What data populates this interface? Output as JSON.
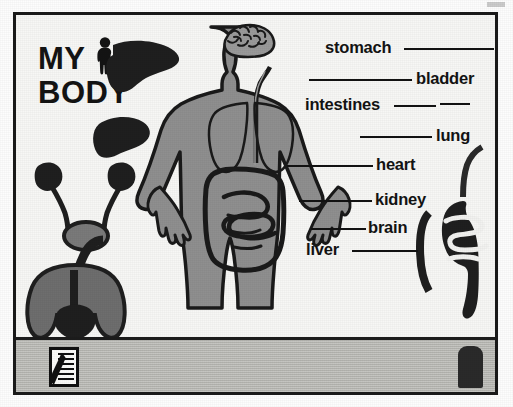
{
  "app": {
    "title_line1": "MY",
    "title_line2": "BODY",
    "person_icon": "person-silhouette-icon"
  },
  "canvas": {
    "background_color": "#f7f7f5",
    "figure_fill_color": "#8f8f8f",
    "outline_color": "#1a1a1a",
    "organ_silhouette_color": "#1f1f1f"
  },
  "labels": [
    {
      "id": "stomach",
      "text": "stomach",
      "leader": "right"
    },
    {
      "id": "bladder",
      "text": "bladder",
      "leader": "left"
    },
    {
      "id": "intestines",
      "text": "intestines",
      "leader": "right"
    },
    {
      "id": "lung",
      "text": "lung",
      "leader": "left"
    },
    {
      "id": "heart",
      "text": "heart",
      "leader": "left"
    },
    {
      "id": "kidney",
      "text": "kidney",
      "leader": "left"
    },
    {
      "id": "brain",
      "text": "brain",
      "leader": "left"
    },
    {
      "id": "liver",
      "text": "liver",
      "leader": "right"
    }
  ],
  "body_diagram": {
    "name": "human-body-figure",
    "organs_drawn": [
      "brain",
      "lungs",
      "heart",
      "esophagus",
      "stomach",
      "intestines"
    ]
  },
  "left_organ_silhouettes": [
    {
      "id": "liver-large",
      "name": "liver-silhouette"
    },
    {
      "id": "liver-small",
      "name": "liver-silhouette"
    },
    {
      "id": "kidneys-bladder",
      "name": "kidneys-bladder-silhouette"
    },
    {
      "id": "lungs-heart",
      "name": "lungs-heart-silhouette"
    }
  ],
  "right_organ_silhouettes": [
    {
      "id": "digestive-tract",
      "name": "stomach-intestines-silhouette"
    }
  ],
  "toolbar": {
    "background_color": "#b9b9b4",
    "notes_tool_label": "notes-tool",
    "stamp_tool_label": "stamp-tool"
  }
}
